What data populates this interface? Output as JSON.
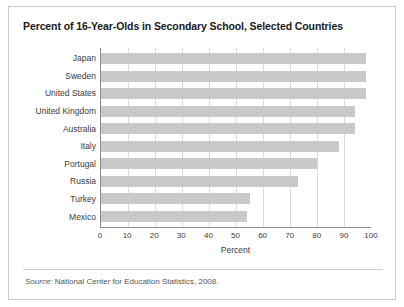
{
  "figure": {
    "title": "Percent of 16-Year-Olds in Secondary School, Selected Countries",
    "source_label": "Source:",
    "source_text": " National Center for Education Statistics, 2008.",
    "border_color": "#c9c9c9",
    "bar_color": "#c9c9c9",
    "grid_color": "#d8d8d8",
    "axis_color": "#8a8a8a"
  },
  "chart_data": {
    "type": "bar",
    "orientation": "horizontal",
    "title": "Percent of 16-Year-Olds in Secondary School, Selected Countries",
    "xlabel": "Percent",
    "ylabel": "",
    "xlim": [
      0,
      100
    ],
    "xticks": [
      0,
      10,
      20,
      30,
      40,
      50,
      60,
      70,
      80,
      90,
      100
    ],
    "xtick_labels": [
      "0",
      "10",
      "20",
      "30",
      "40",
      "50",
      "60",
      "70",
      "80",
      "90",
      "100"
    ],
    "grid": true,
    "grid_axis": "x",
    "legend": false,
    "categories": [
      "Japan",
      "Sweden",
      "United States",
      "United Kingdom",
      "Australia",
      "Italy",
      "Portugal",
      "Russia",
      "Turkey",
      "Mexico"
    ],
    "values": [
      98,
      98,
      98,
      94,
      94,
      88,
      80,
      73,
      55,
      54
    ],
    "series": [
      {
        "name": "Percent enrolled",
        "values": [
          98,
          98,
          98,
          94,
          94,
          88,
          80,
          73,
          55,
          54
        ]
      }
    ]
  }
}
